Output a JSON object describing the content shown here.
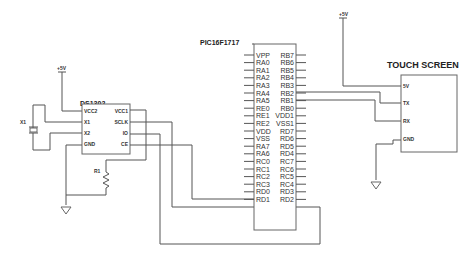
{
  "power": {
    "label": "+5V"
  },
  "rtc": {
    "name": "DS1302",
    "left_pins": [
      "VCC2",
      "X1",
      "X2",
      "GND"
    ],
    "right_pins": [
      "VCC1",
      "SCLK",
      "IO",
      "CE"
    ]
  },
  "crystal": {
    "name": "X1"
  },
  "resistor": {
    "name": "R1"
  },
  "mcu": {
    "name": "PIC16F1717",
    "left_pins": [
      "VPP",
      "RA0",
      "RA1",
      "RA2",
      "RA3",
      "RA4",
      "RA5",
      "RE0",
      "RE1",
      "RE2",
      "VDD",
      "VSS",
      "RA7",
      "RA6",
      "RC0",
      "RC1",
      "RC2",
      "RC3",
      "RD0",
      "RD1"
    ],
    "right_pins": [
      "RB7",
      "RB6",
      "RB5",
      "RB4",
      "RB3",
      "RB2",
      "RB1",
      "RB0",
      "VDD1",
      "VSS1",
      "RD7",
      "RD6",
      "RD5",
      "RD4",
      "RC7",
      "RC6",
      "RC5",
      "RC4",
      "RD3",
      "RD2"
    ]
  },
  "touch_screen": {
    "name": "TOUCH SCREEN",
    "pins": [
      "5V",
      "TX",
      "RX",
      "GND"
    ]
  }
}
